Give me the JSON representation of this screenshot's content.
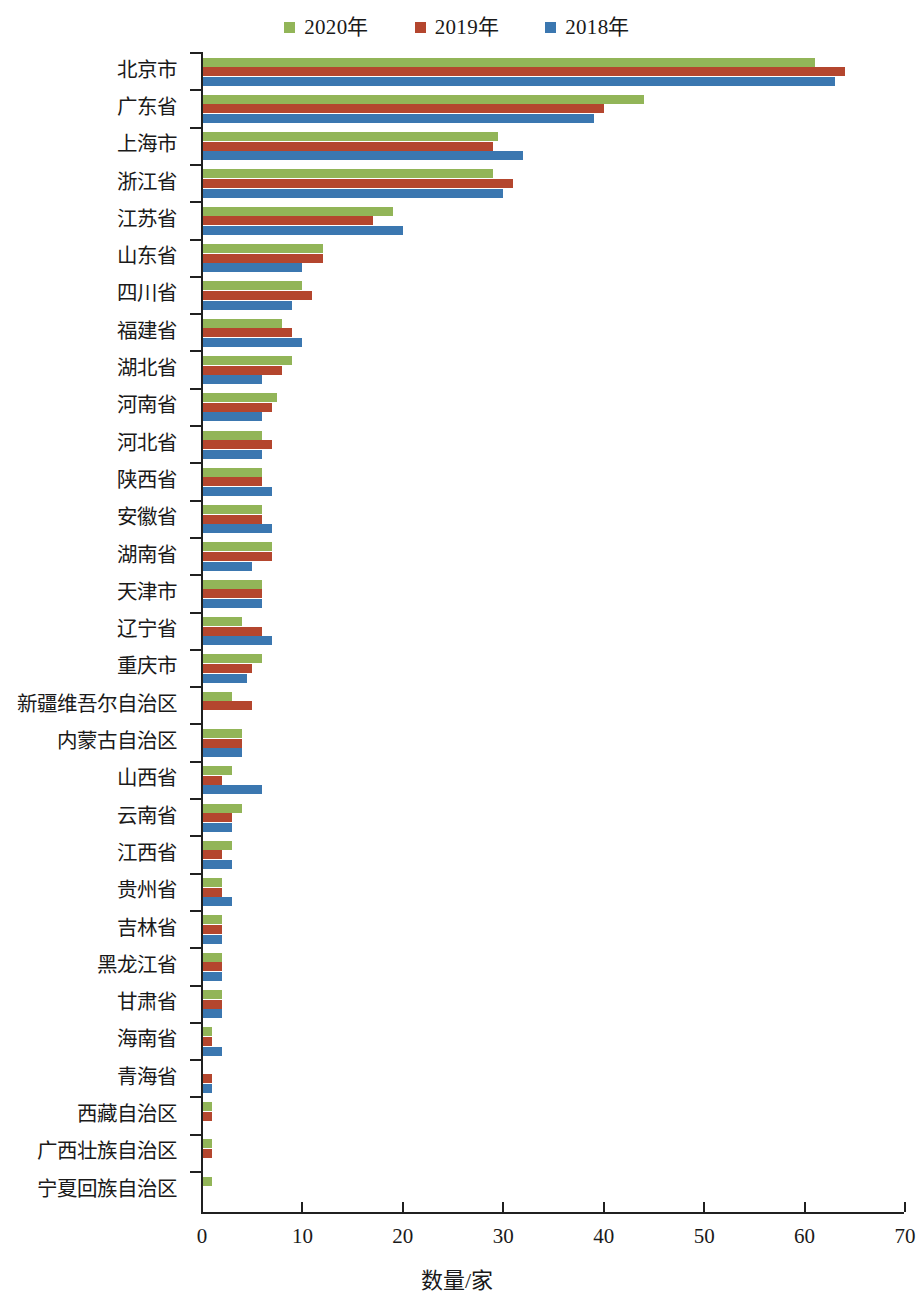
{
  "legend": {
    "items": [
      {
        "label": "2020年",
        "color": "#92b558",
        "key": "y2020"
      },
      {
        "label": "2019年",
        "color": "#b4462e",
        "key": "y2019"
      },
      {
        "label": "2018年",
        "color": "#3b77b0",
        "key": "y2018"
      }
    ]
  },
  "axis": {
    "x_title": "数量/家",
    "x_ticks": [
      "0",
      "10",
      "20",
      "30",
      "40",
      "50",
      "60",
      "70"
    ]
  },
  "chart_data": {
    "type": "bar",
    "orientation": "horizontal",
    "title": "",
    "xlabel": "数量/家",
    "ylabel": "",
    "xlim": [
      0,
      70
    ],
    "xticks": [
      0,
      10,
      20,
      30,
      40,
      50,
      60,
      70
    ],
    "grid": false,
    "legend_position": "top-center",
    "categories": [
      "北京市",
      "广东省",
      "上海市",
      "浙江省",
      "江苏省",
      "山东省",
      "四川省",
      "福建省",
      "湖北省",
      "河南省",
      "河北省",
      "陕西省",
      "安徽省",
      "湖南省",
      "天津市",
      "辽宁省",
      "重庆市",
      "新疆维吾尔自治区",
      "内蒙古自治区",
      "山西省",
      "云南省",
      "江西省",
      "贵州省",
      "吉林省",
      "黑龙江省",
      "甘肃省",
      "海南省",
      "青海省",
      "西藏自治区",
      "广西壮族自治区",
      "宁夏回族自治区"
    ],
    "series": [
      {
        "name": "2020年",
        "color": "#92b558",
        "values": [
          61,
          44,
          29.5,
          29,
          19,
          12,
          10,
          8,
          9,
          7.5,
          6,
          6,
          6,
          7,
          6,
          4,
          6,
          3,
          4,
          3,
          4,
          3,
          2,
          2,
          2,
          2,
          1,
          0,
          1,
          1,
          1
        ]
      },
      {
        "name": "2019年",
        "color": "#b4462e",
        "values": [
          64,
          40,
          29,
          31,
          17,
          12,
          11,
          9,
          8,
          7,
          7,
          6,
          6,
          7,
          6,
          6,
          5,
          5,
          4,
          2,
          3,
          2,
          2,
          2,
          2,
          2,
          1,
          1,
          1,
          1,
          0
        ]
      },
      {
        "name": "2018年",
        "color": "#3b77b0",
        "values": [
          63,
          39,
          32,
          30,
          20,
          10,
          9,
          10,
          6,
          6,
          6,
          7,
          7,
          5,
          6,
          7,
          4.5,
          0,
          4,
          6,
          3,
          3,
          3,
          2,
          2,
          2,
          2,
          1,
          0,
          0,
          0
        ]
      }
    ]
  }
}
